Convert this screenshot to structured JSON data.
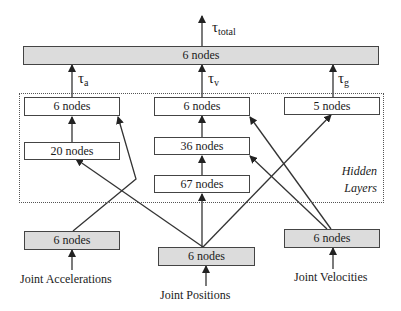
{
  "diagram": {
    "type": "neural-network-architecture",
    "output": {
      "box_label": "6 nodes",
      "output_symbol": "τ",
      "output_subscript": "total"
    },
    "branch_outputs": [
      {
        "symbol": "τ",
        "subscript": "a"
      },
      {
        "symbol": "τ",
        "subscript": "v"
      },
      {
        "symbol": "τ",
        "subscript": "g"
      }
    ],
    "hidden_layers": {
      "title_line1": "Hidden",
      "title_line2": "Layers",
      "left_column": [
        "6 nodes",
        "20 nodes"
      ],
      "middle_column": [
        "6 nodes",
        "36 nodes",
        "67 nodes"
      ],
      "right_column": [
        "5 nodes"
      ]
    },
    "inputs": [
      {
        "box_label": "6 nodes",
        "caption": "Joint Accelerations"
      },
      {
        "box_label": "6 nodes",
        "caption": "Joint Positions"
      },
      {
        "box_label": "6 nodes",
        "caption": "Joint Velocities"
      }
    ],
    "colors": {
      "input_output_fill": "#dcdcdc",
      "hidden_fill": "#ffffff",
      "stroke": "#333333"
    }
  }
}
